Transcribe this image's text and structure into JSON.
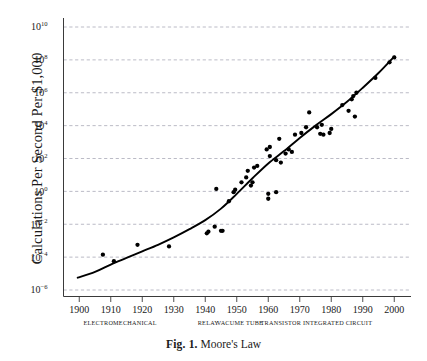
{
  "figure": {
    "caption_label": "Fig. 1.",
    "caption_text": "Moore's Law"
  },
  "chart_data": {
    "type": "scatter",
    "title": "",
    "subtitle": "",
    "xlabel": "",
    "ylabel": "Calculations Per Second Per $1,000",
    "xlim": [
      1895,
      2005
    ],
    "ylim_log10": [
      -6,
      10
    ],
    "y_scale": "log",
    "grid": true,
    "legend": null,
    "y_ticks": [
      {
        "label": "10",
        "exponent": "10",
        "value_log10": 10
      },
      {
        "label": "10",
        "exponent": "8",
        "value_log10": 8
      },
      {
        "label": "10",
        "exponent": "6",
        "value_log10": 6
      },
      {
        "label": "10",
        "exponent": "4",
        "value_log10": 4
      },
      {
        "label": "10",
        "exponent": "2",
        "value_log10": 2
      },
      {
        "label": "10",
        "exponent": "0",
        "value_log10": 0
      },
      {
        "label": "10",
        "exponent": "−2",
        "value_log10": -2
      },
      {
        "label": "10",
        "exponent": "−4",
        "value_log10": -4
      },
      {
        "label": "10",
        "exponent": "−6",
        "value_log10": -6
      }
    ],
    "x_ticks": [
      1900,
      1910,
      1920,
      1930,
      1940,
      1950,
      1960,
      1970,
      1980,
      1990,
      2000
    ],
    "era_bands": [
      {
        "label": "ELECTROMECHANICAL",
        "center_year": 1913
      },
      {
        "label": "RELAY",
        "center_year": 1941
      },
      {
        "label": "VACUME TUBE",
        "center_year": 1951
      },
      {
        "label": "TRANSISTOR",
        "center_year": 1964
      },
      {
        "label": "INTEGRATED CIRCUIT",
        "center_year": 1982
      }
    ],
    "series": [
      {
        "name": "Computing devices",
        "marker": "filled-circle",
        "color": "#000000",
        "points": [
          [
            1907.5,
            -3.85
          ],
          [
            1911.0,
            -4.25
          ],
          [
            1918.5,
            -3.25
          ],
          [
            1928.5,
            -3.35
          ],
          [
            1940.5,
            -2.55
          ],
          [
            1941.0,
            -2.45
          ],
          [
            1943.0,
            -2.15
          ],
          [
            1943.5,
            0.15
          ],
          [
            1945.0,
            -2.4
          ],
          [
            1945.5,
            -2.4
          ],
          [
            1947.5,
            -0.6
          ],
          [
            1949.0,
            -0.05
          ],
          [
            1949.5,
            0.1
          ],
          [
            1951.5,
            0.55
          ],
          [
            1953.0,
            0.85
          ],
          [
            1953.5,
            1.25
          ],
          [
            1954.5,
            0.35
          ],
          [
            1955.0,
            0.55
          ],
          [
            1955.5,
            1.45
          ],
          [
            1956.5,
            1.55
          ],
          [
            1959.5,
            2.55
          ],
          [
            1960.0,
            -0.15
          ],
          [
            1960.0,
            -0.45
          ],
          [
            1960.5,
            2.15
          ],
          [
            1960.5,
            2.7
          ],
          [
            1962.5,
            -0.05
          ],
          [
            1962.5,
            1.9
          ],
          [
            1963.5,
            3.2
          ],
          [
            1964.0,
            1.75
          ],
          [
            1965.5,
            2.3
          ],
          [
            1966.5,
            2.55
          ],
          [
            1967.5,
            2.4
          ],
          [
            1968.5,
            3.45
          ],
          [
            1970.5,
            3.55
          ],
          [
            1972.0,
            3.9
          ],
          [
            1973.0,
            4.8
          ],
          [
            1975.5,
            3.9
          ],
          [
            1976.5,
            3.5
          ],
          [
            1977.0,
            4.05
          ],
          [
            1977.5,
            3.45
          ],
          [
            1979.5,
            3.55
          ],
          [
            1980.0,
            3.8
          ],
          [
            1983.5,
            5.25
          ],
          [
            1985.5,
            4.9
          ],
          [
            1986.5,
            5.6
          ],
          [
            1987.0,
            5.8
          ],
          [
            1987.5,
            4.55
          ],
          [
            1988.0,
            6.0
          ],
          [
            1994.0,
            6.9
          ],
          [
            1998.5,
            7.85
          ],
          [
            2000.0,
            8.15
          ]
        ]
      }
    ],
    "trend_curve": {
      "name": "Moore's Law fit",
      "color": "#000000",
      "points": [
        [
          1899.5,
          -5.25
        ],
        [
          1905.0,
          -4.9
        ],
        [
          1910.0,
          -4.45
        ],
        [
          1915.0,
          -4.05
        ],
        [
          1920.0,
          -3.65
        ],
        [
          1925.0,
          -3.25
        ],
        [
          1930.0,
          -2.8
        ],
        [
          1935.0,
          -2.3
        ],
        [
          1940.0,
          -1.75
        ],
        [
          1945.0,
          -1.05
        ],
        [
          1950.0,
          -0.15
        ],
        [
          1955.0,
          0.8
        ],
        [
          1960.0,
          1.7
        ],
        [
          1965.0,
          2.45
        ],
        [
          1970.0,
          3.25
        ],
        [
          1975.0,
          4.0
        ],
        [
          1980.0,
          4.7
        ],
        [
          1985.0,
          5.45
        ],
        [
          1990.0,
          6.3
        ],
        [
          1995.0,
          7.2
        ],
        [
          2000.0,
          8.2
        ]
      ]
    }
  }
}
